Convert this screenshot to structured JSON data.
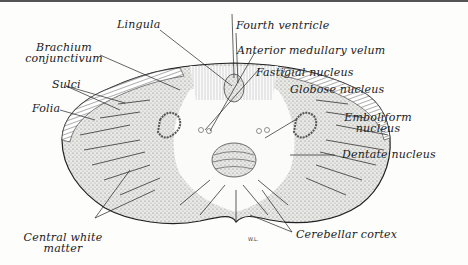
{
  "figure": {
    "signature": "W.L.",
    "colors": {
      "ink": "#1a1a1a",
      "paper": "#fdfdfc",
      "stipple": "#8a8a8a"
    }
  },
  "labels": {
    "lingula": "Lingula",
    "fourth_ventricle": "Fourth ventricle",
    "brachium_line1": "Brachium",
    "brachium_line2": "conjunctivum",
    "anterior_medullary_velum": "Anterior medullary velum",
    "sulci": "Sulci",
    "fastigial_nucleus": "Fastigial nucleus",
    "globose_nucleus": "Globose nucleus",
    "folia": "Folia",
    "emboliform_line1": "Emboliform",
    "emboliform_line2": "nucleus",
    "dentate_nucleus": "Dentate nucleus",
    "central_white_line1": "Central white",
    "central_white_line2": "matter",
    "cerebellar_cortex": "Cerebellar cortex"
  }
}
